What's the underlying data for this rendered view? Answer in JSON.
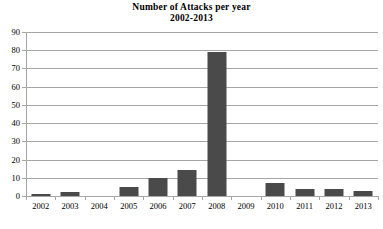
{
  "chart_data": {
    "type": "bar",
    "title": "Number of Attacks per year",
    "subtitle": "2002-2013",
    "xlabel": "",
    "ylabel": "",
    "categories": [
      "2002",
      "2003",
      "2004",
      "2005",
      "2006",
      "2007",
      "2008",
      "2009",
      "2010",
      "2011",
      "2012",
      "2013"
    ],
    "values": [
      1,
      2,
      0,
      5,
      10,
      14,
      79,
      0,
      7,
      4,
      4,
      3
    ],
    "ylim": [
      0,
      90
    ],
    "ytick_labels": [
      "90",
      "80",
      "70",
      "60",
      "50",
      "40",
      "30",
      "20",
      "10",
      "0"
    ],
    "ytick_values": [
      90,
      80,
      70,
      60,
      50,
      40,
      30,
      20,
      10,
      0
    ],
    "ytick_step": 10,
    "grid": true,
    "legend": false,
    "bar_color": "#4a4a4a",
    "gridline_color": "#a6a6a6",
    "background_color": "#ffffff"
  }
}
